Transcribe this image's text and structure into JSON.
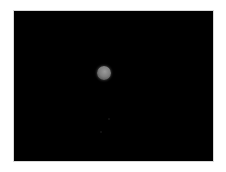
{
  "image": {
    "description": "Astronomical photograph of a small grey planet or moon against a black sky, framed by a white border",
    "subject": "planet",
    "background_color": "#000000",
    "border_color": "#ffffff",
    "subject_color": "#8a8a8a"
  }
}
